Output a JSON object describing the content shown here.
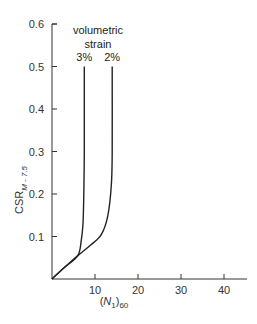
{
  "chart_data": {
    "type": "line",
    "title": "",
    "xlabel": "(N1)60",
    "xlabel_parts": {
      "open": "(",
      "var": "N",
      "sub1": "1",
      "close": ")",
      "sub2": "60"
    },
    "ylabel": "CSR M - 7.5",
    "ylabel_parts": {
      "main": "CSR",
      "sub": "M - 7.5"
    },
    "xlim": [
      0,
      45
    ],
    "ylim": [
      0,
      0.6
    ],
    "x_ticks": [
      10,
      20,
      30,
      40
    ],
    "x_tick_labels": [
      "10",
      "20",
      "30",
      "40"
    ],
    "y_ticks": [
      0.1,
      0.2,
      0.3,
      0.4,
      0.5,
      0.6
    ],
    "y_tick_labels": [
      "0.1",
      "0.2",
      "0.3",
      "0.4",
      "0.5",
      "0.6"
    ],
    "grid": false,
    "annotations": {
      "group_label_line1": "volumetric",
      "group_label_line2": "strain"
    },
    "series": [
      {
        "name": "3%",
        "x": [
          0,
          3,
          6.0,
          6.8,
          7.2,
          7.4,
          7.5,
          7.5
        ],
        "y": [
          0,
          0.028,
          0.055,
          0.09,
          0.13,
          0.2,
          0.3,
          0.5
        ]
      },
      {
        "name": "2%",
        "x": [
          0,
          3,
          6,
          9,
          11.5,
          13.0,
          13.8,
          14.0,
          14.0
        ],
        "y": [
          0,
          0.028,
          0.055,
          0.08,
          0.105,
          0.15,
          0.22,
          0.3,
          0.5
        ]
      }
    ]
  }
}
